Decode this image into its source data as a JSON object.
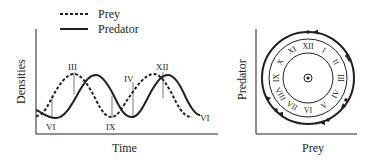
{
  "left_panel": {
    "legend": [
      {
        "label": "Prey",
        "style": "dashed"
      },
      {
        "label": "Predator",
        "style": "solid"
      }
    ],
    "ylabel": "Densities",
    "xlabel": "Time",
    "annotations": [
      "VI",
      "III",
      "IX",
      "IV",
      "XII",
      "VI"
    ]
  },
  "right_panel": {
    "ylabel": "Predator",
    "xlabel": "Prey",
    "clock_numerals": [
      "XII",
      "I",
      "II",
      "III",
      "IV",
      "V",
      "VI",
      "VII",
      "VIII",
      "IX",
      "X",
      "XI"
    ]
  },
  "chart_data": [
    {
      "type": "line",
      "title": "",
      "xlabel": "Time",
      "ylabel": "Densities",
      "legend_position": "top",
      "grid": false,
      "series": [
        {
          "name": "Prey",
          "style": "dashed",
          "description": "sinusoidal oscillation, peaks at month III and IV–XII, leads predator by ~quarter cycle"
        },
        {
          "name": "Predator",
          "style": "solid",
          "description": "sinusoidal oscillation lagging prey, peaks shortly after prey peaks"
        }
      ],
      "annotations": [
        {
          "label": "VI",
          "position": "first predator trough"
        },
        {
          "label": "III",
          "position": "first prey peak"
        },
        {
          "label": "IX",
          "position": "prey trough"
        },
        {
          "label": "IV",
          "position": "rising prey second cycle"
        },
        {
          "label": "XII",
          "position": "second predator peak"
        },
        {
          "label": "VI",
          "position": "end of series"
        }
      ]
    },
    {
      "type": "phase-cycle",
      "xlabel": "Prey",
      "ylabel": "Predator",
      "description": "closed counter-clockwise-arrowed cycle around a clock face with months I–XII",
      "clock_numerals": [
        "XII",
        "I",
        "II",
        "III",
        "IV",
        "V",
        "VI",
        "VII",
        "VIII",
        "IX",
        "X",
        "XI"
      ]
    }
  ]
}
